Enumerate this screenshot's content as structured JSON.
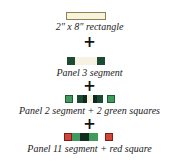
{
  "steps": [
    {
      "caption": "2\" x 8\" rectangle"
    },
    {
      "caption": "Panel 3 segment"
    },
    {
      "caption": "Panel 2 segment + 2 green squares"
    },
    {
      "caption": "Panel 11 segment + red square"
    }
  ],
  "plus_symbol": "+",
  "colors": {
    "cream": "#f7f3dc",
    "cream_border": "#8a8550",
    "dark_green": "#1c4a32",
    "black_green": "#0f2a1c",
    "green": "#3f9a5c",
    "red": "#d0463a"
  }
}
